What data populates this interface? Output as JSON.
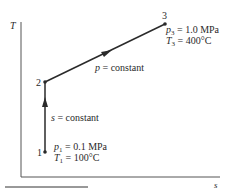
{
  "diagram": {
    "type": "T-s diagram",
    "axes": {
      "y_label": "T",
      "x_label": "s"
    },
    "points": [
      {
        "id": "1",
        "label": "1",
        "p_var": "p",
        "p_sub": "1",
        "p_value": " = 0.1 MPa",
        "t_var": "T",
        "t_sub": "1",
        "t_value": " = 100°C"
      },
      {
        "id": "2",
        "label": "2"
      },
      {
        "id": "3",
        "label": "3",
        "p_var": "p",
        "p_sub": "3",
        "p_value": " = 1.0 MPa",
        "t_var": "T",
        "t_sub": "3",
        "t_value": " = 400°C"
      }
    ],
    "processes": [
      {
        "from": "1",
        "to": "2",
        "var": "s",
        "text": " = constant"
      },
      {
        "from": "2",
        "to": "3",
        "var": "p",
        "text": " = constant"
      }
    ],
    "colors": {
      "line": "#2a2a2a",
      "axis": "#555555"
    }
  }
}
